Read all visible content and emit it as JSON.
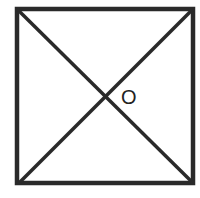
{
  "diagram": {
    "type": "square-with-diagonals",
    "stroke_color": "#2a2a2a",
    "background": "#ffffff",
    "vertices": {
      "top_left": [
        17,
        9
      ],
      "top_right": [
        193,
        9
      ],
      "bottom_right": [
        193,
        183
      ],
      "bottom_left": [
        19,
        183
      ]
    },
    "center_label": "O",
    "center_label_pos": [
      130,
      104
    ]
  }
}
